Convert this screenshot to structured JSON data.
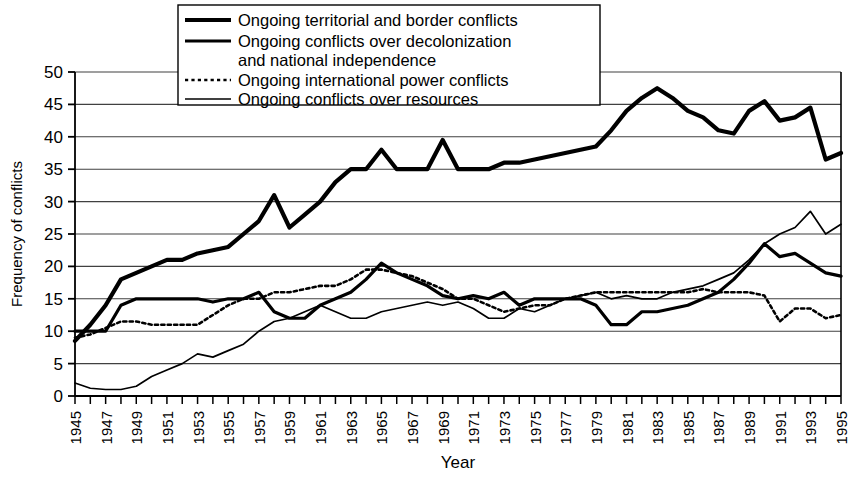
{
  "chart_data": {
    "type": "line",
    "title": "",
    "xlabel": "Year",
    "ylabel": "Frequency of conflicts",
    "ylim": [
      0,
      50
    ],
    "ytick_step": 5,
    "yticks": [
      0,
      5,
      10,
      15,
      20,
      25,
      30,
      35,
      40,
      45,
      50
    ],
    "xlim": [
      1945,
      1995
    ],
    "xticks": [
      1945,
      1947,
      1949,
      1951,
      1953,
      1955,
      1957,
      1959,
      1961,
      1963,
      1965,
      1967,
      1969,
      1971,
      1973,
      1975,
      1977,
      1979,
      1981,
      1983,
      1985,
      1987,
      1989,
      1991,
      1993,
      1995
    ],
    "x": [
      1945,
      1946,
      1947,
      1948,
      1949,
      1950,
      1951,
      1952,
      1953,
      1954,
      1955,
      1956,
      1957,
      1958,
      1959,
      1960,
      1961,
      1962,
      1963,
      1964,
      1965,
      1966,
      1967,
      1968,
      1969,
      1970,
      1971,
      1972,
      1973,
      1974,
      1975,
      1976,
      1977,
      1978,
      1979,
      1980,
      1981,
      1982,
      1983,
      1984,
      1985,
      1986,
      1987,
      1988,
      1989,
      1990,
      1991,
      1992,
      1993,
      1994,
      1995
    ],
    "grid": true,
    "legend_position": "top-center",
    "series": [
      {
        "name": "Ongoing territorial and border conflicts",
        "style": "thick-solid",
        "values": [
          8.5,
          11,
          14,
          18,
          19,
          20,
          21,
          21,
          22,
          22.5,
          23,
          25,
          27,
          31,
          26,
          28,
          30,
          33,
          35,
          35,
          38,
          35,
          35,
          35,
          39.5,
          35,
          35,
          35,
          36,
          36,
          36.5,
          37,
          37.5,
          38,
          38.5,
          41,
          44,
          46,
          47.5,
          46,
          44,
          43,
          41,
          40.5,
          44,
          45.5,
          42.5,
          43,
          44.5,
          36.5,
          37.5
        ]
      },
      {
        "name": "Ongoing conflicts over decolonization and national independence",
        "style": "medium-solid",
        "values": [
          10,
          10,
          10,
          14,
          15,
          15,
          15,
          15,
          15,
          14.5,
          15,
          15,
          16,
          13,
          12,
          12,
          14,
          15,
          16,
          18,
          20.5,
          19,
          18,
          17,
          15.5,
          15,
          15.5,
          15,
          16,
          14,
          15,
          15,
          15,
          15,
          14,
          11,
          11,
          13,
          13,
          13.5,
          14,
          15,
          16,
          18,
          20.5,
          23.5,
          21.5,
          22,
          20.5,
          19,
          18.5
        ]
      },
      {
        "name": "Ongoing international power conflicts",
        "style": "dotted",
        "values": [
          9,
          9.5,
          10.5,
          11.5,
          11.5,
          11,
          11,
          11,
          11,
          12.5,
          14,
          15,
          15,
          16,
          16,
          16.5,
          17,
          17,
          18,
          19.5,
          19.5,
          19,
          18.5,
          17.5,
          16.5,
          15,
          15,
          14,
          13,
          13.5,
          14,
          14,
          15,
          15.5,
          16,
          16,
          16,
          16,
          16,
          16,
          16,
          16.5,
          16,
          16,
          16,
          15.5,
          11.5,
          13.5,
          13.5,
          12,
          12.5
        ]
      },
      {
        "name": "Ongoing conflicts over resources",
        "style": "thin-solid",
        "values": [
          2,
          1.2,
          1,
          1,
          1.5,
          3,
          4,
          5,
          6.5,
          6,
          7,
          8,
          10,
          11.5,
          12,
          13,
          14,
          13,
          12,
          12,
          13,
          13.5,
          14,
          14.5,
          14,
          14.5,
          13.5,
          12,
          12,
          13.5,
          13,
          14,
          15,
          15.5,
          16,
          15,
          15.5,
          15,
          15,
          16,
          16.5,
          17,
          18,
          19,
          21,
          23.5,
          25,
          26,
          28.5,
          25,
          26.5
        ]
      }
    ]
  },
  "legend": {
    "entries": [
      {
        "label": "Ongoing territorial and border conflicts",
        "style": "thick-solid"
      },
      {
        "label": "Ongoing conflicts over decolonization",
        "label2": "and national independence",
        "style": "medium-solid"
      },
      {
        "label": "Ongoing international power conflicts",
        "style": "dotted"
      },
      {
        "label": "Ongoing conflicts over resources",
        "style": "thin-solid"
      }
    ]
  },
  "colors": {
    "line": "#000000",
    "grid": "#404040",
    "axis": "#000000",
    "background": "#ffffff"
  }
}
